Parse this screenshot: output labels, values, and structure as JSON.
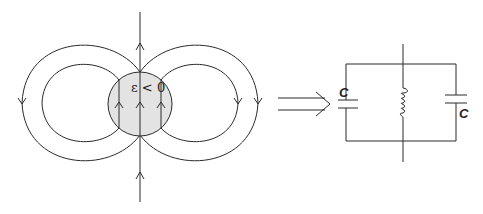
{
  "diagram": {
    "left_panel": {
      "description": "Magnetic field lines around a sphere with negative permittivity",
      "sphere_label": "ε < 0",
      "sphere_fill": "#e3e3e3"
    },
    "arrow": {
      "type": "double-arrow-right"
    },
    "right_panel": {
      "description": "Equivalent LC circuit",
      "capacitor_left_label": "C",
      "capacitor_right_label": "C",
      "inductor": "coil"
    }
  }
}
